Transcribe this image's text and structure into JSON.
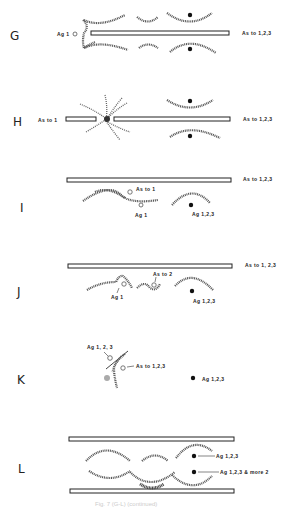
{
  "figure": {
    "caption": "Fig. 7 (G-L) (continued)",
    "panels": [
      {
        "id": "G",
        "labels": {
          "left": "Ag 1",
          "right": "As to 1,2,3"
        }
      },
      {
        "id": "H",
        "labels": {
          "left": "As to 1",
          "right": "As to 1,2,3"
        }
      },
      {
        "id": "I",
        "labels": {
          "right": "As to 1,2,3",
          "as": "As to 1",
          "ag": "Ag 1",
          "ag_dot": "Ag 1,2,3"
        }
      },
      {
        "id": "J",
        "labels": {
          "right": "As to 1, 2,3",
          "as": "As to 2",
          "ag": "Ag 1",
          "ag_dot": "Ag 1,2,3"
        }
      },
      {
        "id": "K",
        "labels": {
          "ag_top": "Ag 1, 2, 3",
          "as": "As to 1,2,3",
          "ag_dot": "Ag 1,2,3"
        }
      },
      {
        "id": "L",
        "labels": {
          "ag_top": "Ag 1,2,3",
          "ag_bottom": "Ag 1,2,3 & more 2"
        }
      }
    ]
  }
}
